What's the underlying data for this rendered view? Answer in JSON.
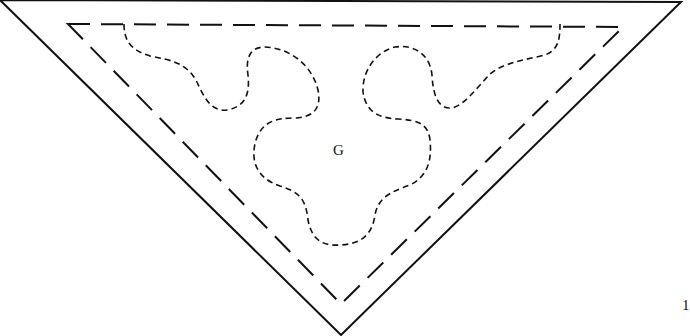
{
  "diagram": {
    "region_label": "G",
    "page_marker": "1",
    "colors": {
      "stroke": "#111111",
      "background": "#ffffff"
    },
    "outer_triangle": {
      "points": [
        [
          0,
          0
        ],
        [
          681,
          2
        ],
        [
          341,
          335
        ]
      ],
      "style": "solid"
    },
    "inner_triangle": {
      "points": [
        [
          68,
          24
        ],
        [
          623,
          27
        ],
        [
          341,
          304
        ]
      ],
      "style": "long-dash"
    },
    "inner_boundary": {
      "style": "short-dash",
      "description": "wavy closed region G attached to top edge of inner triangle"
    }
  }
}
